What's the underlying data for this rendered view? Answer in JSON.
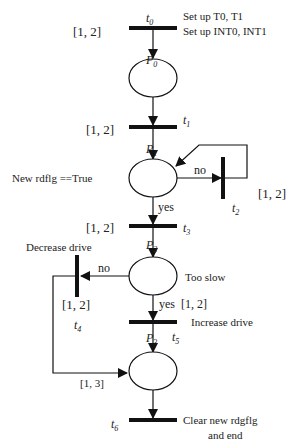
{
  "diagram": {
    "type": "petri-net",
    "transitions": [
      {
        "id": "t0",
        "label": "t",
        "sub": "0",
        "interval": "[1, 2]",
        "annotation": [
          "Set up T0, T1",
          "Set up INT0, INT1"
        ]
      },
      {
        "id": "t1",
        "label": "t",
        "sub": "1",
        "interval": "[1, 2]"
      },
      {
        "id": "t2",
        "label": "t",
        "sub": "2",
        "interval": "[1, 2]"
      },
      {
        "id": "t3",
        "label": "t",
        "sub": "3",
        "interval": "[1, 2]"
      },
      {
        "id": "t4",
        "label": "t",
        "sub": "4",
        "interval": "[1, 2]",
        "annotation": [
          "Decrease drive"
        ]
      },
      {
        "id": "t5",
        "label": "t",
        "sub": "5",
        "interval": "[1, 2]",
        "annotation": [
          "Increase drive"
        ]
      },
      {
        "id": "t6",
        "label": "t",
        "sub": "6",
        "annotation": [
          "Clear new rdgflg",
          "and end"
        ]
      }
    ],
    "places": [
      {
        "id": "P0",
        "label": "P",
        "sub": "0"
      },
      {
        "id": "P1",
        "label": "P",
        "sub": "1",
        "condition": "New rdflg ==True"
      },
      {
        "id": "P2",
        "label": "P",
        "sub": "2",
        "condition": "Too slow"
      },
      {
        "id": "P3",
        "label": "P",
        "sub": "3"
      }
    ],
    "arcs": {
      "p1_yes": "yes",
      "p1_no": "no",
      "p2_yes": "yes",
      "p2_no": "no",
      "t4_to_p3_interval": "[1, 3]"
    }
  }
}
